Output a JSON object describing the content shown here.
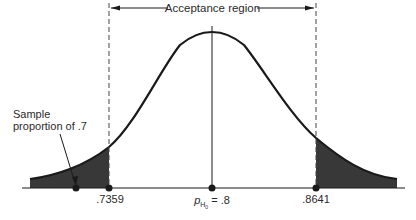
{
  "diagram": {
    "title": "Acceptance region",
    "annotation": {
      "line1": "Sample",
      "line2": "proportion of .7"
    },
    "x_ticks": [
      {
        "label": ".7359",
        "value": 0.7359
      },
      {
        "label": ".8",
        "value": 0.8,
        "prefix": "p",
        "subscript": "H0",
        "equals": " = "
      },
      {
        "label": ".8641",
        "value": 0.8641
      }
    ],
    "sample_point": {
      "value": 0.7
    },
    "colors": {
      "curve": "#1a1a1a",
      "shade": "#3a3a3a",
      "dashed": "#444444"
    },
    "distribution": "normal",
    "shaded_tails": [
      "left",
      "right"
    ]
  }
}
